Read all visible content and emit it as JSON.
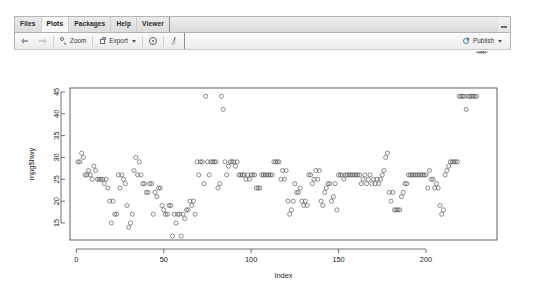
{
  "window": {
    "name": "rstudio-plots-pane",
    "minimize_label": "—"
  },
  "tabs": [
    {
      "label": "Files",
      "active": false,
      "name": "tab-files"
    },
    {
      "label": "Plots",
      "active": true,
      "name": "tab-plots"
    },
    {
      "label": "Packages",
      "active": false,
      "name": "tab-packages"
    },
    {
      "label": "Help",
      "active": false,
      "name": "tab-help"
    },
    {
      "label": "Viewer",
      "active": false,
      "name": "tab-viewer"
    }
  ],
  "toolbar": {
    "back_icon": "arrow-left-icon",
    "forward_icon": "arrow-right-icon",
    "zoom_label": "Zoom",
    "zoom_icon": "magnifier-icon",
    "export_label": "Export",
    "export_icon": "export-icon",
    "export_caret": "chevron-down-icon",
    "remove_icon": "remove-plot-icon",
    "clear_icon": "broom-icon",
    "publish_label": "Publish",
    "publish_icon": "publish-icon",
    "publish_caret": "chevron-down-icon"
  },
  "chart_data": {
    "type": "scatter",
    "title": "",
    "xlabel": "Index",
    "ylabel": "mpg$hwy",
    "xlim": [
      -3.65,
      240.65
    ],
    "ylim": [
      11.1,
      45.9
    ],
    "xticks": [
      0,
      50,
      100,
      150,
      200
    ],
    "yticks": [
      15,
      20,
      25,
      30,
      35,
      40,
      45
    ],
    "grid": false,
    "legend": null,
    "point_symbol": "open-circle",
    "point_color": "#4a4a4a",
    "n_points": 234,
    "x": [
      1,
      2,
      3,
      4,
      5,
      6,
      7,
      8,
      9,
      10,
      11,
      12,
      13,
      14,
      15,
      16,
      17,
      18,
      19,
      20,
      21,
      22,
      23,
      24,
      25,
      26,
      27,
      28,
      29,
      30,
      31,
      32,
      33,
      34,
      35,
      36,
      37,
      38,
      39,
      40,
      41,
      42,
      43,
      44,
      45,
      46,
      47,
      48,
      49,
      50,
      51,
      52,
      53,
      54,
      55,
      56,
      57,
      58,
      59,
      60,
      61,
      62,
      63,
      64,
      65,
      66,
      67,
      68,
      69,
      70,
      71,
      72,
      73,
      74,
      75,
      76,
      77,
      78,
      79,
      80,
      81,
      82,
      83,
      84,
      85,
      86,
      87,
      88,
      89,
      90,
      91,
      92,
      93,
      94,
      95,
      96,
      97,
      98,
      99,
      100,
      101,
      102,
      103,
      104,
      105,
      106,
      107,
      108,
      109,
      110,
      111,
      112,
      113,
      114,
      115,
      116,
      117,
      118,
      119,
      120,
      121,
      122,
      123,
      124,
      125,
      126,
      127,
      128,
      129,
      130,
      131,
      132,
      133,
      134,
      135,
      136,
      137,
      138,
      139,
      140,
      141,
      142,
      143,
      144,
      145,
      146,
      147,
      148,
      149,
      150,
      151,
      152,
      153,
      154,
      155,
      156,
      157,
      158,
      159,
      160,
      161,
      162,
      163,
      164,
      165,
      166,
      167,
      168,
      169,
      170,
      171,
      172,
      173,
      174,
      175,
      176,
      177,
      178,
      179,
      180,
      181,
      182,
      183,
      184,
      185,
      186,
      187,
      188,
      189,
      190,
      191,
      192,
      193,
      194,
      195,
      196,
      197,
      198,
      199,
      200,
      201,
      202,
      203,
      204,
      205,
      206,
      207,
      208,
      209,
      210,
      211,
      212,
      213,
      214,
      215,
      216,
      217,
      218,
      219,
      220,
      221,
      222,
      223,
      224,
      225,
      226,
      227,
      228,
      229,
      230,
      231,
      232,
      233,
      234
    ],
    "y": [
      29,
      29,
      31,
      30,
      26,
      26,
      27,
      26,
      25,
      28,
      27,
      25,
      25,
      25,
      25,
      24,
      25,
      23,
      20,
      15,
      20,
      17,
      17,
      26,
      23,
      26,
      25,
      24,
      19,
      14,
      15,
      17,
      27,
      30,
      26,
      29,
      26,
      24,
      24,
      22,
      22,
      24,
      24,
      17,
      22,
      21,
      23,
      23,
      19,
      18,
      17,
      17,
      19,
      19,
      12,
      17,
      15,
      17,
      17,
      12,
      17,
      16,
      18,
      18,
      20,
      19,
      20,
      17,
      29,
      26,
      29,
      29,
      24,
      44,
      29,
      26,
      29,
      29,
      29,
      29,
      23,
      24,
      44,
      41,
      29,
      26,
      28,
      29,
      29,
      29,
      28,
      29,
      26,
      26,
      26,
      26,
      25,
      26,
      25,
      26,
      26,
      26,
      23,
      23,
      23,
      26,
      26,
      26,
      26,
      26,
      26,
      26,
      29,
      29,
      29,
      29,
      25,
      27,
      25,
      27,
      20,
      17,
      18,
      20,
      24,
      22,
      22,
      23,
      20,
      19,
      20,
      19,
      26,
      26,
      24,
      25,
      27,
      25,
      27,
      20,
      19,
      22,
      23,
      24,
      24,
      20,
      21,
      24,
      18,
      26,
      26,
      26,
      25,
      26,
      26,
      26,
      26,
      26,
      26,
      26,
      26,
      26,
      24,
      25,
      26,
      24,
      25,
      26,
      24,
      25,
      24,
      25,
      24,
      25,
      26,
      27,
      30,
      31,
      22,
      20,
      22,
      18,
      18,
      18,
      18,
      21,
      22,
      24,
      24,
      26,
      26,
      26,
      26,
      26,
      26,
      26,
      26,
      26,
      26,
      26,
      23,
      27,
      25,
      25,
      23,
      24,
      23,
      19,
      17,
      18,
      26,
      27,
      28,
      29,
      29,
      29,
      29,
      29,
      44,
      44,
      44,
      44,
      41,
      44,
      44,
      44,
      44,
      44,
      44
    ]
  }
}
